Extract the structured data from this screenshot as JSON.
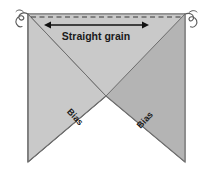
{
  "diagram": {
    "background_color": "#ffffff",
    "labels": {
      "straight_grain": "Straight grain",
      "bias_left": "Bias",
      "bias_right": "Bias"
    },
    "colors": {
      "fabric_light": "#c9c9c9",
      "fabric_dark": "#b4b4b4",
      "outline": "#6e6e6e",
      "dashed_line": "#3a3a3a",
      "arrow": "#111111",
      "thread": "#5a5a5a",
      "text": "#1a1a1a"
    },
    "elements": {
      "grain_arrow": "double-headed-arrow",
      "selvage_line": "dashed-horizontal-line",
      "thread_left": "curly-thread",
      "thread_right": "curly-thread"
    },
    "geometry": {
      "top_left": [
        28,
        14
      ],
      "top_right": [
        185,
        14
      ],
      "bottom_left": [
        28,
        162
      ],
      "bottom_right": [
        185,
        162
      ],
      "notch_apex": [
        106,
        96
      ],
      "arrow_y": 25,
      "arrow_x_start": 45,
      "arrow_x_end": 148,
      "dash_y": 17
    }
  }
}
